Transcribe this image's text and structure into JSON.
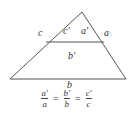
{
  "diagram": {
    "type": "similar-triangles",
    "stroke_color": "#555555",
    "triangle": {
      "apex": [
        82,
        12
      ],
      "bottom_left": [
        10,
        79
      ],
      "bottom_right": [
        126,
        79
      ]
    },
    "parallel_line": {
      "from": [
        44,
        42
      ],
      "to": [
        106,
        42
      ]
    },
    "labels": {
      "c": "c",
      "c_prime": "c′",
      "a_prime": "a′",
      "a": "a",
      "b_prime": "b′",
      "b": "b"
    }
  },
  "formula": {
    "fractions": [
      {
        "numerator": "a′",
        "denominator": "a"
      },
      {
        "numerator": "b′",
        "denominator": "b"
      },
      {
        "numerator": "c′",
        "denominator": "c"
      }
    ],
    "equals": "="
  }
}
